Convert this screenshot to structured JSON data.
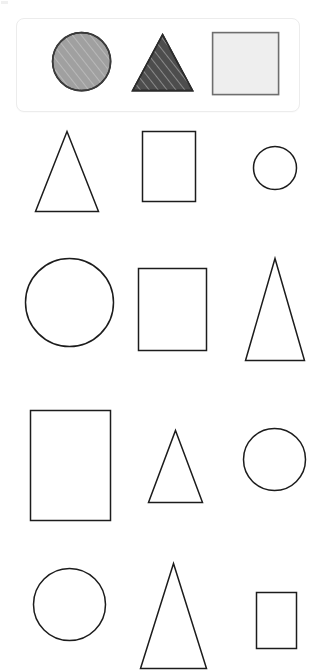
{
  "canvas": {
    "width": 316,
    "height": 659,
    "background": "#ffffff",
    "title": "Shapes Gallery"
  },
  "palette": {
    "outline": "#1c1c1c",
    "legend_border": "#ececec",
    "circle_fill": "#a0a0a0",
    "circle_stroke": "#3a3a3a",
    "triangle_fill": "#4d4d4d",
    "triangle_stroke": "#2b2b2b",
    "square_fill": "#eeeeee",
    "square_stroke": "#6e6e6e",
    "hatch_light": "#d8d8d8",
    "hatch_dark": "#8f8f8f"
  },
  "legend": {
    "name": "reference-shapes-card",
    "shapes": [
      {
        "kind": "circle",
        "label": "Filled hatched circle",
        "fill": "#a0a0a0",
        "stroke": "#3a3a3a",
        "hatched": true,
        "x": 52,
        "y": 32,
        "size": 58
      },
      {
        "kind": "triangle",
        "label": "Filled hatched triangle",
        "fill": "#4d4d4d",
        "stroke": "#2b2b2b",
        "hatched": true,
        "x": 132,
        "y": 34,
        "width": 60,
        "height": 56
      },
      {
        "kind": "square",
        "label": "Filled light square",
        "fill": "#eeeeee",
        "stroke": "#6e6e6e",
        "hatched": false,
        "x": 212,
        "y": 32,
        "width": 66,
        "height": 62
      }
    ]
  },
  "grid": {
    "name": "outline-shapes-grid",
    "columns": 3,
    "rows": 4,
    "last_row_clipped": true,
    "items": [
      {
        "row": 1,
        "col": 1,
        "kind": "triangle",
        "label": "Outline triangle",
        "x": 35,
        "y": 131,
        "width": 63,
        "height": 80
      },
      {
        "row": 1,
        "col": 2,
        "kind": "rectangle",
        "label": "Outline rectangle",
        "x": 142,
        "y": 131,
        "width": 53,
        "height": 70
      },
      {
        "row": 1,
        "col": 3,
        "kind": "circle",
        "label": "Outline circle",
        "x": 253,
        "y": 146,
        "size": 43
      },
      {
        "row": 2,
        "col": 1,
        "kind": "circle",
        "label": "Outline circle",
        "x": 25,
        "y": 258,
        "size": 88
      },
      {
        "row": 2,
        "col": 2,
        "kind": "rectangle",
        "label": "Outline square",
        "x": 138,
        "y": 268,
        "width": 68,
        "height": 82
      },
      {
        "row": 2,
        "col": 3,
        "kind": "triangle",
        "label": "Outline tall triangle",
        "x": 245,
        "y": 258,
        "width": 59,
        "height": 102
      },
      {
        "row": 3,
        "col": 1,
        "kind": "rectangle",
        "label": "Outline tall rectangle",
        "x": 30,
        "y": 410,
        "width": 80,
        "height": 110
      },
      {
        "row": 3,
        "col": 2,
        "kind": "triangle",
        "label": "Outline small triangle",
        "x": 148,
        "y": 430,
        "width": 54,
        "height": 72
      },
      {
        "row": 3,
        "col": 3,
        "kind": "circle",
        "label": "Outline circle",
        "x": 243,
        "y": 428,
        "size": 62
      },
      {
        "row": 4,
        "col": 1,
        "kind": "circle",
        "label": "Outline circle",
        "x": 33,
        "y": 568,
        "size": 72
      },
      {
        "row": 4,
        "col": 2,
        "kind": "triangle",
        "label": "Outline tall triangle",
        "x": 140,
        "y": 563,
        "width": 66,
        "height": 105
      },
      {
        "row": 4,
        "col": 3,
        "kind": "rectangle",
        "label": "Outline small rectangle",
        "x": 256,
        "y": 592,
        "width": 40,
        "height": 56
      }
    ]
  }
}
